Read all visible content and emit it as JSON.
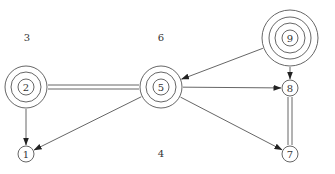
{
  "diagram": {
    "width": 335,
    "height": 174,
    "stroke_color": "#555555",
    "background": "#ffffff",
    "nodes": [
      {
        "id": "1",
        "label": "1",
        "x": 26,
        "y": 154,
        "rings": [
          8
        ]
      },
      {
        "id": "2",
        "label": "2",
        "x": 26,
        "y": 87,
        "rings": [
          8,
          15,
          21
        ]
      },
      {
        "id": "5",
        "label": "5",
        "x": 161,
        "y": 87,
        "rings": [
          8,
          15,
          21
        ]
      },
      {
        "id": "7",
        "label": "7",
        "x": 290,
        "y": 154,
        "rings": [
          8
        ]
      },
      {
        "id": "8",
        "label": "8",
        "x": 290,
        "y": 88,
        "rings": [
          8
        ]
      },
      {
        "id": "9",
        "label": "9",
        "x": 290,
        "y": 38,
        "rings": [
          8,
          15,
          21,
          28
        ]
      }
    ],
    "free_labels": [
      {
        "id": "3",
        "label": "3",
        "x": 27,
        "y": 41
      },
      {
        "id": "6",
        "label": "6",
        "x": 161,
        "y": 41
      },
      {
        "id": "4",
        "label": "4",
        "x": 161,
        "y": 157
      }
    ],
    "edges": [
      {
        "from": "2",
        "to": "5",
        "type": "double"
      },
      {
        "from": "8",
        "to": "7",
        "type": "double"
      },
      {
        "from": "2",
        "to": "1",
        "type": "arrow"
      },
      {
        "from": "5",
        "to": "1",
        "type": "arrow"
      },
      {
        "from": "5",
        "to": "8",
        "type": "arrow"
      },
      {
        "from": "5",
        "to": "7",
        "type": "arrow"
      },
      {
        "from": "9",
        "to": "5",
        "type": "arrow"
      },
      {
        "from": "9",
        "to": "8",
        "type": "arrow"
      }
    ]
  }
}
